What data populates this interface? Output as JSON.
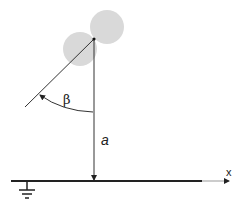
{
  "diagram": {
    "title": "",
    "labels": {
      "angle": "β",
      "height": "a",
      "axis": "x"
    },
    "colors": {
      "background": "#ffffff",
      "line": "#333333",
      "ground_line": "#222222",
      "axis_tail": "#888888",
      "sphere_fill": "#d9d9d9"
    },
    "elements": [
      {
        "id": "sphere-upper",
        "type": "circle",
        "cx": 107,
        "cy": 27,
        "r": 17
      },
      {
        "id": "sphere-lower",
        "type": "circle",
        "cx": 80,
        "cy": 49,
        "r": 17
      },
      {
        "id": "pivot-point",
        "type": "point",
        "x": 94,
        "y": 39
      },
      {
        "id": "vertical-line",
        "from": [
          94,
          39
        ],
        "to": [
          94,
          181
        ],
        "arrow_end": true
      },
      {
        "id": "slant-line",
        "from": [
          25,
          107
        ],
        "to": [
          94,
          39
        ]
      },
      {
        "id": "angle-arc",
        "from": [
          40,
          95
        ],
        "to": [
          93,
          112
        ],
        "arrow_start": true
      },
      {
        "id": "ground-line",
        "from": [
          11,
          181
        ],
        "to": [
          202,
          181
        ]
      },
      {
        "id": "x-axis-tail",
        "from": [
          202,
          181
        ],
        "to": [
          230,
          181
        ],
        "arrow_end": true
      },
      {
        "id": "ground-symbol",
        "x": 27,
        "y": 181
      }
    ]
  }
}
